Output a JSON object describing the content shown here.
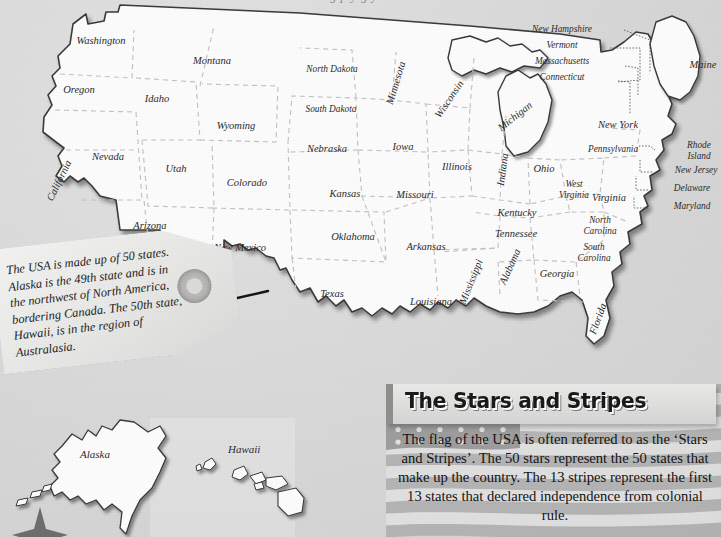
{
  "page": {
    "background_color": "#d9d9d9",
    "top_cut_text": "g p y g y"
  },
  "map": {
    "title": "United States of America",
    "land_color": "#fbfbfb",
    "border_color": "#3a3a3a",
    "state_border_color": "#bcbcbc",
    "states": [
      {
        "name": "Washington",
        "x": 101,
        "y": 44
      },
      {
        "name": "Oregon",
        "x": 79,
        "y": 93
      },
      {
        "name": "California",
        "x": 62,
        "y": 182,
        "rot": -64
      },
      {
        "name": "Nevada",
        "x": 108,
        "y": 160
      },
      {
        "name": "Idaho",
        "x": 157,
        "y": 102
      },
      {
        "name": "Montana",
        "x": 212,
        "y": 64
      },
      {
        "name": "Wyoming",
        "x": 236,
        "y": 129
      },
      {
        "name": "Utah",
        "x": 176,
        "y": 172
      },
      {
        "name": "Arizona",
        "x": 150,
        "y": 229
      },
      {
        "name": "Colorado",
        "x": 247,
        "y": 186
      },
      {
        "name": "New Mexico",
        "x": 240,
        "y": 251
      },
      {
        "name": "North Dakota",
        "x": 332,
        "y": 72
      },
      {
        "name": "South Dakota",
        "x": 331,
        "y": 112
      },
      {
        "name": "Nebraska",
        "x": 327,
        "y": 152
      },
      {
        "name": "Kansas",
        "x": 345,
        "y": 197
      },
      {
        "name": "Oklahoma",
        "x": 353,
        "y": 240
      },
      {
        "name": "Texas",
        "x": 332,
        "y": 297
      },
      {
        "name": "Minnesota",
        "x": 399,
        "y": 84,
        "rot": -73
      },
      {
        "name": "Iowa",
        "x": 403,
        "y": 150
      },
      {
        "name": "Missouri",
        "x": 415,
        "y": 198
      },
      {
        "name": "Arkansas",
        "x": 426,
        "y": 250
      },
      {
        "name": "Louisiana",
        "x": 431,
        "y": 305
      },
      {
        "name": "Wisconsin",
        "x": 452,
        "y": 101,
        "rot": -56
      },
      {
        "name": "Illinois",
        "x": 457,
        "y": 170
      },
      {
        "name": "Michigan",
        "x": 517,
        "y": 119,
        "rot": -38
      },
      {
        "name": "Indiana",
        "x": 506,
        "y": 170,
        "rot": -82
      },
      {
        "name": "Ohio",
        "x": 544,
        "y": 172
      },
      {
        "name": "Kentucky",
        "x": 517,
        "y": 216
      },
      {
        "name": "Tennessee",
        "x": 516,
        "y": 237
      },
      {
        "name": "Mississippi",
        "x": 474,
        "y": 283,
        "rot": -68
      },
      {
        "name": "Alabama",
        "x": 513,
        "y": 268,
        "rot": -66
      },
      {
        "name": "Georgia",
        "x": 557,
        "y": 277
      },
      {
        "name": "Florida",
        "x": 601,
        "y": 320,
        "rot": -70
      },
      {
        "name": "South Carolina",
        "x": 594,
        "y": 250,
        "two_line": true
      },
      {
        "name": "North Carolina",
        "x": 600,
        "y": 223,
        "two_line": true
      },
      {
        "name": "Virginia",
        "x": 609,
        "y": 201
      },
      {
        "name": "West Virginia",
        "x": 574,
        "y": 187,
        "two_line": true
      },
      {
        "name": "Pennsylvania",
        "x": 613,
        "y": 152
      },
      {
        "name": "New York",
        "x": 618,
        "y": 128
      },
      {
        "name": "Maine",
        "x": 703,
        "y": 68
      }
    ],
    "leader_labels": [
      {
        "name": "New Hampshire",
        "x": 562,
        "y": 32
      },
      {
        "name": "Vermont",
        "x": 562,
        "y": 48
      },
      {
        "name": "Massachusetts",
        "x": 562,
        "y": 64
      },
      {
        "name": "Connecticut",
        "x": 562,
        "y": 80
      },
      {
        "name": "Rhode Island",
        "x": 699,
        "y": 148,
        "two_line": true
      },
      {
        "name": "New Jersey",
        "x": 696,
        "y": 173
      },
      {
        "name": "Delaware",
        "x": 692,
        "y": 191
      },
      {
        "name": "Maryland",
        "x": 692,
        "y": 209
      }
    ],
    "insets": [
      {
        "name": "Alaska",
        "label_x": 107,
        "label_y": 456
      },
      {
        "name": "Hawaii",
        "label_x": 253,
        "label_y": 451
      }
    ]
  },
  "tag": {
    "text": "The USA is made up of 50 states. Alaska is the 49th state and is in the northwest of North America, bordering Canada. The 50th state, Hawaii, is in the region of Australasia."
  },
  "stars_and_stripes": {
    "title": "The Stars and Stripes",
    "body": "The flag of the USA is often referred to as the ‘Stars and Stripes’. The 50 stars represent the 50 states that make up the country. The 13 stripes represent the first 13 states that declared independence from colonial rule.",
    "flag_red": "#9a9a9a",
    "flag_white": "#e8e8e8",
    "flag_blue": "#707070"
  }
}
